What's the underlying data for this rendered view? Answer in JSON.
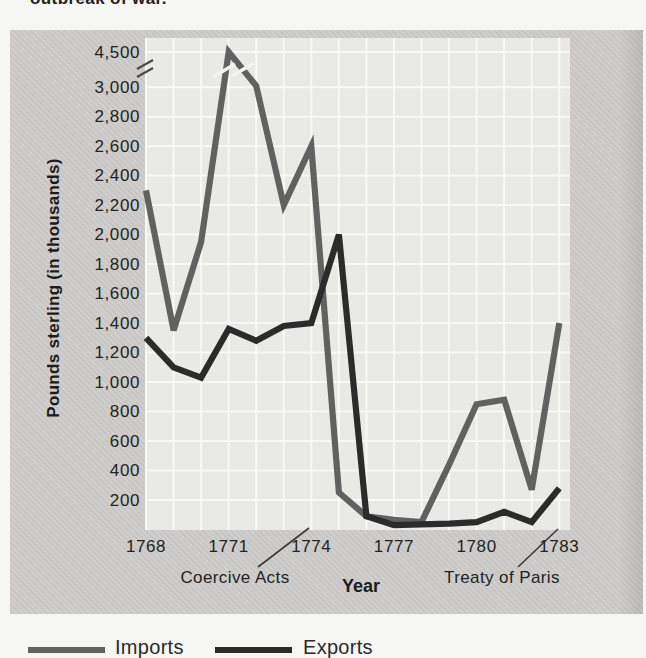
{
  "caption_fragment": "outbreak of war.",
  "colors": {
    "page_bg": "#f6f6f4",
    "panel_bg": "#cdccca",
    "plot_bg": "#e9e9e7",
    "gridline": "#f8f8f6",
    "imports_line": "#616161",
    "exports_line": "#2b2b2b",
    "text": "#232323"
  },
  "chart_data": {
    "type": "line",
    "title": "",
    "xlabel": "Year",
    "ylabel": "Pounds sterling (in thousands)",
    "grid": true,
    "x": [
      1768,
      1769,
      1770,
      1771,
      1772,
      1773,
      1774,
      1775,
      1776,
      1777,
      1778,
      1779,
      1780,
      1781,
      1782,
      1783
    ],
    "x_ticks": {
      "years": [
        1768,
        1771,
        1774,
        1777,
        1780,
        1783
      ],
      "labels": [
        "1768",
        "1771",
        "1774",
        "1777",
        "1780",
        "1783"
      ]
    },
    "y_ticks": {
      "values": [
        200,
        400,
        600,
        800,
        1000,
        1200,
        1400,
        1600,
        1800,
        2000,
        2200,
        2400,
        2600,
        2800,
        3000,
        4500
      ],
      "labels": [
        "200",
        "400",
        "600",
        "800",
        "1,000",
        "1,200",
        "1,400",
        "1,600",
        "1,800",
        "2,000",
        "2,200",
        "2,400",
        "2,600",
        "2,800",
        "3,000",
        "4,500"
      ]
    },
    "ylim": [
      0,
      4500
    ],
    "axis_break": {
      "between": [
        3000,
        4500
      ]
    },
    "series": [
      {
        "name": "Imports",
        "color": "#616161",
        "values": [
          2300,
          1350,
          1950,
          4500,
          3050,
          2200,
          2600,
          250,
          90,
          65,
          50,
          440,
          850,
          880,
          270,
          1400
        ],
        "note_on_peak": "1771 value drawn above axis break"
      },
      {
        "name": "Exports",
        "color": "#2b2b2b",
        "values": [
          1300,
          1100,
          1030,
          1360,
          1280,
          1380,
          1400,
          2000,
          90,
          30,
          35,
          40,
          50,
          120,
          50,
          280
        ]
      }
    ],
    "annotations": [
      {
        "label": "Coercive Acts",
        "points_to_year": 1774
      },
      {
        "label": "Treaty of Paris",
        "points_to_year": 1783
      }
    ],
    "legend_position": "bottom-left"
  }
}
